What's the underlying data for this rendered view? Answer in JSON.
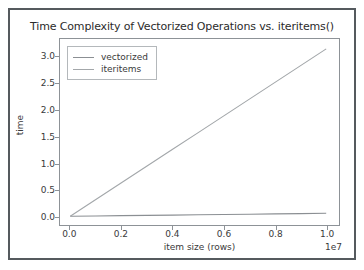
{
  "chart_data": {
    "type": "line",
    "title": "Time Complexity of Vectorized Operations vs. iteritems()",
    "xlabel": "item size (rows)",
    "ylabel": "time",
    "x_offset_text": "1e7",
    "grid": false,
    "legend_position": "upper left",
    "xlim": [
      -0.04,
      1.05
    ],
    "ylim": [
      -0.16,
      3.33
    ],
    "xticks": [
      0.0,
      0.2,
      0.4,
      0.6,
      0.8,
      1.0
    ],
    "xticklabels": [
      "0.0",
      "0.2",
      "0.4",
      "0.6",
      "0.8",
      "1.0"
    ],
    "yticks": [
      0.0,
      0.5,
      1.0,
      1.5,
      2.0,
      2.5,
      3.0
    ],
    "yticklabels": [
      "0.0",
      "0.5",
      "1.0",
      "1.5",
      "2.0",
      "2.5",
      "3.0"
    ],
    "x": [
      0.0,
      0.1,
      0.2,
      0.3,
      0.4,
      0.5,
      0.6,
      0.7,
      0.8,
      0.9,
      1.0
    ],
    "series": [
      {
        "name": "vectorized",
        "color": "#8b8f93",
        "values": [
          0.004,
          0.01,
          0.015,
          0.021,
          0.026,
          0.032,
          0.038,
          0.043,
          0.049,
          0.054,
          0.06
        ]
      },
      {
        "name": "iteritems",
        "color": "#a3a7aa",
        "values": [
          0.004,
          0.318,
          0.632,
          0.946,
          1.26,
          1.574,
          1.888,
          2.202,
          2.516,
          2.83,
          3.145
        ]
      }
    ]
  },
  "chart": {
    "title": "Time Complexity of Vectorized Operations vs. iteritems()",
    "xlabel": "item size (rows)",
    "ylabel": "time",
    "x_offset_text": "1e7",
    "xticklabels": [
      "0.0",
      "0.2",
      "0.4",
      "0.6",
      "0.8",
      "1.0"
    ],
    "yticklabels": [
      "0.0",
      "0.5",
      "1.0",
      "1.5",
      "2.0",
      "2.5",
      "3.0"
    ],
    "legend": [
      {
        "label": "vectorized",
        "color": "#8b8f93"
      },
      {
        "label": "iteritems",
        "color": "#a3a7aa"
      }
    ]
  }
}
